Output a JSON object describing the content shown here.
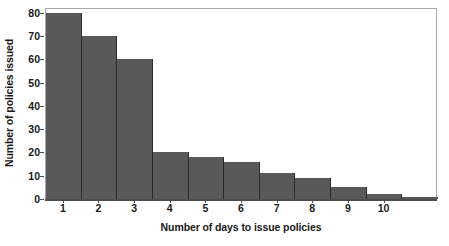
{
  "chart_data": {
    "type": "bar",
    "title": "",
    "subtitle": "",
    "xlabel": "Number of days to issue policies",
    "ylabel": "Number of policies issued",
    "categories": [
      "1",
      "2",
      "3",
      "4",
      "5",
      "6",
      "7",
      "8",
      "9",
      "10",
      ""
    ],
    "values": [
      80,
      70,
      60,
      20,
      18,
      16,
      11,
      9,
      5,
      2,
      1
    ],
    "x_tick_labels": [
      "1",
      "2",
      "3",
      "4",
      "5",
      "6",
      "7",
      "8",
      "9",
      "10"
    ],
    "y_tick_labels": [
      "0",
      "10",
      "20",
      "30",
      "40",
      "50",
      "60",
      "70",
      "80"
    ],
    "y_tick_values": [
      0,
      10,
      20,
      30,
      40,
      50,
      60,
      70,
      80
    ],
    "ylim": [
      0,
      82
    ],
    "xlim": [
      0.5,
      11.5
    ],
    "grid": false,
    "legend": false,
    "legend_position": "none",
    "bar_color": "#595959",
    "bar_edge_color": "#2b2b2b",
    "axis_color": "#4d4d4d",
    "frame_color": "#a8a8a8",
    "background_color": "#ffffff",
    "text_color": "#1a1a1a"
  }
}
